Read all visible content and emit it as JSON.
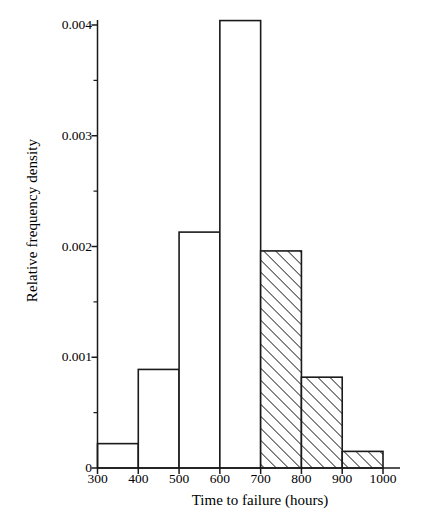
{
  "chart_data": {
    "type": "bar",
    "title": "",
    "subtitle": "",
    "xlabel": "Time to failure (hours)",
    "ylabel": "Relative frequency density",
    "categories": [
      "300-400",
      "400-500",
      "500-600",
      "600-700",
      "700-800",
      "800-900",
      "900-1000"
    ],
    "bin_edges": [
      300,
      400,
      500,
      600,
      700,
      800,
      900,
      1000
    ],
    "values": [
      0.00022,
      0.00089,
      0.00213,
      0.00404,
      0.00196,
      0.00082,
      0.00015
    ],
    "bar_styles": [
      "open",
      "open",
      "open",
      "open",
      "hatched",
      "hatched",
      "hatched"
    ],
    "xlim": [
      300,
      1000
    ],
    "ylim": [
      0,
      0.004
    ],
    "xticks": [
      300,
      400,
      500,
      600,
      700,
      800,
      900,
      1000
    ],
    "xtick_labels": [
      "300",
      "400",
      "500",
      "600",
      "700",
      "800",
      "900",
      "1000"
    ],
    "yticks": [
      0,
      0.001,
      0.002,
      0.003,
      0.004
    ],
    "ytick_labels": [
      "0",
      "0.001",
      "0.002",
      "0.003",
      "0.004"
    ],
    "yminor_ticks": [
      0.0005,
      0.0015,
      0.0025,
      0.0035
    ],
    "grid": false,
    "legend": null,
    "colors": {
      "axis": "#1a1a1a",
      "bar_edge": "#1a1a1a",
      "bar_fill": "#ffffff",
      "hatch": "#1a1a1a",
      "background": "#ffffff"
    }
  }
}
